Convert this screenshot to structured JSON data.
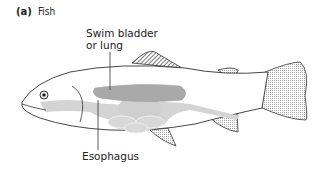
{
  "figure": {
    "panel": "(a)",
    "title": "Fish",
    "labels": {
      "swim_bladder_line1": "Swim bladder",
      "swim_bladder_line2": "or lung",
      "esophagus": "Esophagus"
    },
    "colors": {
      "outline": "#333333",
      "swim_bladder": "#a9a9a9",
      "digestive": "#d4d4d4",
      "fin_stipple": "#bbbbbb"
    }
  }
}
